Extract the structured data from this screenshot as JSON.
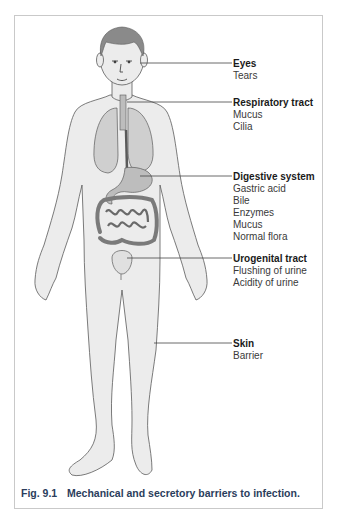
{
  "figure": {
    "caption_number": "Fig. 9.1",
    "caption_text": "Mechanical and secretory barriers to infection.",
    "colors": {
      "body_fill": "#ececec",
      "outline": "#5a5a5a",
      "organ_fill": "#bdbdbd",
      "caption": "#2b3d5c",
      "frame": "#c9c9c9"
    }
  },
  "labels": [
    {
      "title": "Eyes",
      "items": [
        "Tears"
      ]
    },
    {
      "title": "Respiratory tract",
      "items": [
        "Mucus",
        "Cilia"
      ]
    },
    {
      "title": "Digestive system",
      "items": [
        "Gastric acid",
        "Bile",
        "Enzymes",
        "Mucus",
        "Normal flora"
      ]
    },
    {
      "title": "Urogenital tract",
      "items": [
        "Flushing of urine",
        "Acidity of urine"
      ]
    },
    {
      "title": "Skin",
      "items": [
        "Barrier"
      ]
    }
  ]
}
